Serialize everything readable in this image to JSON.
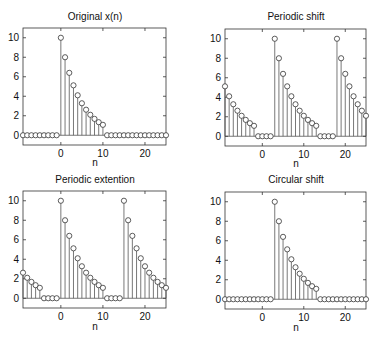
{
  "chart_data": [
    {
      "type": "stem",
      "title": "Original x(n)",
      "xlabel": "n",
      "ylabel": "",
      "xlim": [
        -9,
        25
      ],
      "ylim": [
        -1,
        11
      ],
      "xticks": [
        0,
        10,
        20
      ],
      "yticks": [
        0,
        2,
        4,
        6,
        8,
        10
      ],
      "grid": false,
      "x": [
        -9,
        -8,
        -7,
        -6,
        -5,
        -4,
        -3,
        -2,
        -1,
        0,
        1,
        2,
        3,
        4,
        5,
        6,
        7,
        8,
        9,
        10,
        11,
        12,
        13,
        14,
        15,
        16,
        17,
        18,
        19,
        20,
        21,
        22,
        23,
        24,
        25
      ],
      "values": [
        0,
        0,
        0,
        0,
        0,
        0,
        0,
        0,
        0,
        10,
        8,
        6.4,
        5.12,
        4.1,
        3.28,
        2.62,
        2.1,
        1.68,
        1.34,
        1.07,
        0,
        0,
        0,
        0,
        0,
        0,
        0,
        0,
        0,
        0,
        0,
        0,
        0,
        0,
        0
      ]
    },
    {
      "type": "stem",
      "title": "Periodic shift",
      "xlabel": "n",
      "ylabel": "",
      "xlim": [
        -9,
        25
      ],
      "ylim": [
        -1,
        11
      ],
      "xticks": [
        0,
        10,
        20
      ],
      "yticks": [
        0,
        2,
        4,
        6,
        8,
        10
      ],
      "grid": false,
      "x": [
        -9,
        -8,
        -7,
        -6,
        -5,
        -4,
        -3,
        -2,
        -1,
        0,
        1,
        2,
        3,
        4,
        5,
        6,
        7,
        8,
        9,
        10,
        11,
        12,
        13,
        14,
        15,
        16,
        17,
        18,
        19,
        20,
        21,
        22,
        23,
        24,
        25
      ],
      "values": [
        5.12,
        4.1,
        3.28,
        2.62,
        2.1,
        1.68,
        1.34,
        1.07,
        0,
        0,
        0,
        0,
        10,
        8,
        6.4,
        5.12,
        4.1,
        3.28,
        2.62,
        2.1,
        1.68,
        1.34,
        1.07,
        0,
        0,
        0,
        0,
        10,
        8,
        6.4,
        5.12,
        4.1,
        3.28,
        2.62,
        2.1
      ]
    },
    {
      "type": "stem",
      "title": "Periodic extention",
      "xlabel": "n",
      "ylabel": "",
      "xlim": [
        -9,
        25
      ],
      "ylim": [
        -1,
        11
      ],
      "xticks": [
        0,
        10,
        20
      ],
      "yticks": [
        0,
        2,
        4,
        6,
        8,
        10
      ],
      "grid": false,
      "x": [
        -9,
        -8,
        -7,
        -6,
        -5,
        -4,
        -3,
        -2,
        -1,
        0,
        1,
        2,
        3,
        4,
        5,
        6,
        7,
        8,
        9,
        10,
        11,
        12,
        13,
        14,
        15,
        16,
        17,
        18,
        19,
        20,
        21,
        22,
        23,
        24,
        25
      ],
      "values": [
        2.62,
        2.1,
        1.68,
        1.34,
        1.07,
        0,
        0,
        0,
        0,
        10,
        8,
        6.4,
        5.12,
        4.1,
        3.28,
        2.62,
        2.1,
        1.68,
        1.34,
        1.07,
        0,
        0,
        0,
        0,
        10,
        8,
        6.4,
        5.12,
        4.1,
        3.28,
        2.62,
        2.1,
        1.68,
        1.34,
        1.07
      ]
    },
    {
      "type": "stem",
      "title": "Circular shift",
      "xlabel": "n",
      "ylabel": "",
      "xlim": [
        -9,
        25
      ],
      "ylim": [
        -1,
        11
      ],
      "xticks": [
        0,
        10,
        20
      ],
      "yticks": [
        0,
        2,
        4,
        6,
        8,
        10
      ],
      "grid": false,
      "x": [
        -9,
        -8,
        -7,
        -6,
        -5,
        -4,
        -3,
        -2,
        -1,
        0,
        1,
        2,
        3,
        4,
        5,
        6,
        7,
        8,
        9,
        10,
        11,
        12,
        13,
        14,
        15,
        16,
        17,
        18,
        19,
        20,
        21,
        22,
        23,
        24,
        25
      ],
      "values": [
        0,
        0,
        0,
        0,
        0,
        0,
        0,
        0,
        0,
        0,
        0,
        0,
        10,
        8,
        6.4,
        5.12,
        4.1,
        3.28,
        2.62,
        2.1,
        1.68,
        1.34,
        1.07,
        0,
        0,
        0,
        0,
        0,
        0,
        0,
        0,
        0,
        0,
        0,
        0
      ]
    }
  ],
  "style": {
    "stem_color": "#555555",
    "marker_edge": "#333333",
    "marker_fill": "#ffffff",
    "axes_color": "#333333"
  }
}
